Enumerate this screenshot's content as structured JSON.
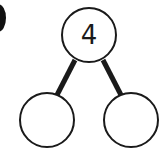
{
  "diagram": {
    "type": "number-bond",
    "colors": {
      "stroke": "#1a1a1a",
      "fill": "#ffffff",
      "marker": "#111111"
    },
    "whole": {
      "label": "4",
      "cx": 89,
      "cy": 35,
      "r": 27
    },
    "parts": [
      {
        "label": "",
        "cx": 47,
        "cy": 120,
        "r": 27
      },
      {
        "label": "",
        "cx": 131,
        "cy": 120,
        "r": 27
      }
    ],
    "connectors": [
      {
        "x1": 75,
        "y1": 60,
        "x2": 57,
        "y2": 95
      },
      {
        "x1": 103,
        "y1": 60,
        "x2": 121,
        "y2": 95
      }
    ],
    "edge_marker": {
      "cx": -2,
      "cy": 18,
      "rx": 8,
      "ry": 14
    }
  }
}
